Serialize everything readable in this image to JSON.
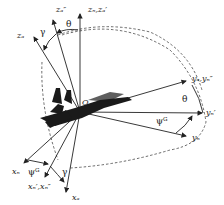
{
  "diagram": {
    "type": "aircraft-coordinate-frames",
    "origin_label": "O",
    "axes": [
      {
        "id": "z_n_z_b_prime",
        "label": "zₙ,zₐ′",
        "label_text": "zn,zb'"
      },
      {
        "id": "z_b_dprime",
        "label": "zₐ″",
        "label_text": "zb''"
      },
      {
        "id": "z_b",
        "label": "zₐ",
        "label_text": "zb"
      },
      {
        "id": "y_b_y_n_dprime",
        "label": "yₐ,yₙ″",
        "label_text": "yb,yn''"
      },
      {
        "id": "y_n_prime",
        "label": "yₙ′",
        "label_text": "yn'"
      },
      {
        "id": "y_n",
        "label": "yₙ",
        "label_text": "yn"
      },
      {
        "id": "x_n",
        "label": "xₙ",
        "label_text": "xn"
      },
      {
        "id": "x_n_prime_x_n_dprime",
        "label": "xₙ′,xₙ″",
        "label_text": "xn',xn''"
      },
      {
        "id": "x_b",
        "label": "xₐ",
        "label_text": "xb"
      }
    ],
    "angles": {
      "theta_top": "θ",
      "gamma_top": "γ",
      "theta_right": "θ",
      "psi_right": "ψᴳ",
      "psi_bottom": "ψᴳ",
      "gamma_bottom": "γ"
    },
    "colors": {
      "line": "#222222",
      "dashed": "#444444",
      "aircraft": "#1a1a1a"
    }
  }
}
